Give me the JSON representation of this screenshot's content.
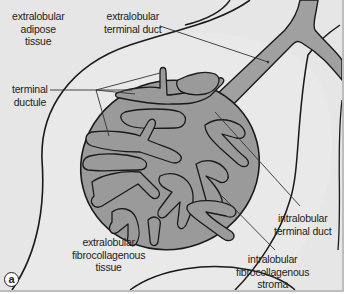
{
  "figure": {
    "panel_letter": "a",
    "colors": {
      "background": "#e6e6e6",
      "lobule_fill": "#9a9a9a",
      "duct_fill": "#a0a0a0",
      "duct_lumen": "#e2e2e2",
      "outline": "#1a1a1a",
      "frame_border": "#bdbdbd"
    },
    "labels": {
      "extralobular_adipose": [
        "extralobular",
        "adipose",
        "tissue"
      ],
      "extralobular_terminal_duct": [
        "extralobular",
        "terminal duct"
      ],
      "terminal_ductule": [
        "terminal",
        "ductule"
      ],
      "extralobular_fibrocollagenous": [
        "extralobular",
        "fibrocollagenous",
        "tissue"
      ],
      "intralobular_terminal_duct": [
        "intralobular",
        "terminal duct"
      ],
      "intralobular_fibrocollagenous": [
        "intralobular",
        "fibrocollagenous",
        "stroma"
      ]
    }
  }
}
